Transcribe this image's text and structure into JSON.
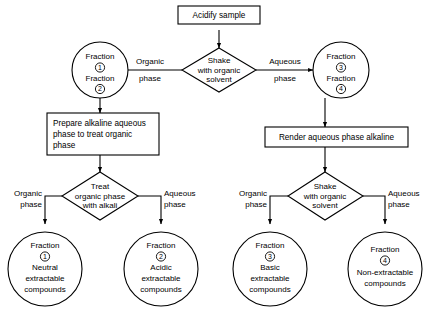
{
  "diagram": {
    "title_text": "Acidify sample",
    "nodes": {
      "acidify": {
        "label": "Acidify sample",
        "shape": "rect"
      },
      "shake_top": {
        "line1": "Shake",
        "line2": "with organic",
        "line3": "solvent",
        "shape": "diamond"
      },
      "fraction_12": {
        "line1": "Fraction",
        "num1": "1",
        "line2": "Fraction",
        "num2": "2",
        "shape": "circle"
      },
      "fraction_34": {
        "line1": "Fraction",
        "num1": "3",
        "line2": "Fraction",
        "num2": "4",
        "shape": "circle"
      },
      "prepare_alkaline": {
        "line1": "Prepare alkaline aqueous",
        "line2": "phase to  treat  organic",
        "line3": "phase",
        "shape": "rect"
      },
      "render_alkaline": {
        "line1": "Render aqueous phase  alkaline",
        "shape": "rect"
      },
      "treat_alkali": {
        "line1": "Treat",
        "line2": "organic  phase",
        "line3": "with alkali",
        "shape": "diamond"
      },
      "shake_bottom": {
        "line1": "Shake",
        "line2": "with organic",
        "line3": "solvent",
        "shape": "diamond"
      },
      "fraction_1": {
        "line1": "Fraction",
        "num": "1",
        "line2": "Neutral",
        "line3": "extractable",
        "line4": "compounds",
        "shape": "circle"
      },
      "fraction_2": {
        "line1": "Fraction",
        "num": "2",
        "line2": "Acidic",
        "line3": "extractable",
        "line4": "compounds",
        "shape": "circle"
      },
      "fraction_3": {
        "line1": "Fraction",
        "num": "3",
        "line2": "Basic",
        "line3": "extractable",
        "line4": "compounds",
        "shape": "circle"
      },
      "fraction_4": {
        "line1": "Fraction",
        "num": "4",
        "line2": "Non-extractable",
        "line3": "compounds",
        "shape": "circle"
      }
    },
    "edge_labels": {
      "organic_top": {
        "line1": "Organic",
        "line2": "phase"
      },
      "aqueous_top": {
        "line1": "Aqueous",
        "line2": "phase"
      },
      "organic_left": {
        "line1": "Organic",
        "line2": "phase"
      },
      "aqueous_left": {
        "line1": "Aqueous",
        "line2": "phase"
      },
      "organic_right": {
        "line1": "Organic",
        "line2": "phase"
      },
      "aqueous_right": {
        "line1": "Aqueous",
        "line2": "phase"
      }
    },
    "colors": {
      "stroke": "#000000",
      "fill": "#ffffff",
      "text": "#000000"
    }
  }
}
